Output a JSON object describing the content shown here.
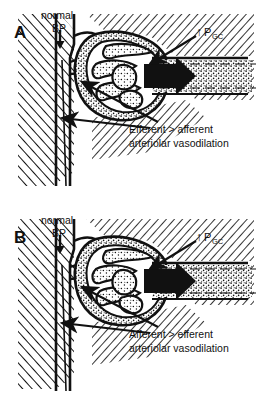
{
  "figure": {
    "background_color": "#ffffff",
    "ink_color": "#111111"
  },
  "panels": [
    {
      "id": "A",
      "letter": "A",
      "bp_label_line1": "normal",
      "bp_label_line2": "BP",
      "bp_arrow_glyph": "↓",
      "pressure_label_arrow": "↑",
      "pressure_label_base": "P",
      "pressure_label_sub": "GC",
      "annotation_line1": "Efferent  >  afferent",
      "annotation_line2": "arteriolar vasodilation",
      "structures": {
        "tissue": "hatched-interstitium",
        "artery": "interlobular-artery",
        "glomerulus": "stippled-glomerular-tuft",
        "capsule": "bowmans-capsule",
        "flow_arrow": "solid-black-flow-arrow",
        "tubule": "stippled-tubule-dashed"
      }
    },
    {
      "id": "B",
      "letter": "B",
      "bp_label_line1": "normal",
      "bp_label_line2": "BP",
      "bp_arrow_glyph": "↓",
      "pressure_label_arrow": "↑",
      "pressure_label_base": "P",
      "pressure_label_sub": "GC",
      "annotation_line1": "Afferent  >  efferent",
      "annotation_line2": "arteriolar vasodilation",
      "structures": {
        "tissue": "hatched-interstitium",
        "artery": "interlobular-artery",
        "glomerulus": "stippled-glomerular-tuft",
        "capsule": "bowmans-capsule",
        "flow_arrow": "solid-black-flow-arrow",
        "tubule": "stippled-tubule-dashed"
      }
    }
  ]
}
